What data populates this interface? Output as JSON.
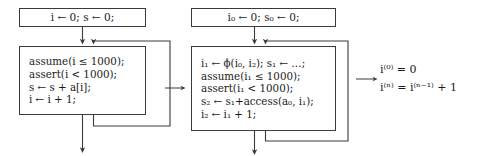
{
  "figure": {
    "type": "control-flow-graph-transformation"
  },
  "stage1": {
    "entry": {
      "line": "i ← 0; s ← 0;"
    },
    "loop": {
      "lines": [
        "assume(i ≤ 1000);",
        "assert(i < 1000);",
        "s ← s + a[i];",
        "i ← i + 1;"
      ]
    }
  },
  "stage2": {
    "entry": {
      "line": "i₀ ← 0; s₀ ← 0;"
    },
    "loop": {
      "lines": [
        "i₁ ← ϕ(i₀, i₂); s₁ ← …;",
        "assume(i₁ ≤ 1000);",
        "assert(i₁ < 1000);",
        "s₂ ← s₁+access(a₀, i₁);",
        "i₂ ← i₁ + 1;"
      ]
    }
  },
  "stage3": {
    "equations": [
      "i⁽⁰⁾ = 0",
      "i⁽ⁿ⁾ = i⁽ⁿ⁻¹⁾ + 1"
    ]
  },
  "transitions": {
    "arrow1_label": "→",
    "arrow2_label": "→"
  },
  "colors": {
    "box_border": "#3a3a3a",
    "wire": "#3a3a3a",
    "text": "#1a1a1a",
    "background": "#ffffff"
  }
}
